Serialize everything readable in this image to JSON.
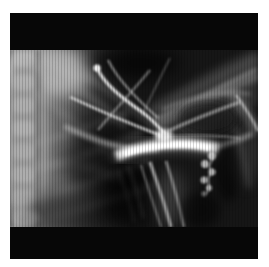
{
  "figure": {
    "type": "radiograph",
    "alt": "Black-and-white X-ray angiogram film showing the cervical spine and ribs on the left, contrast-filled arteries crossing the center and converging into a bright vascular trunk, with shoulder and arm soft tissue in the upper right"
  },
  "colors": {
    "page_background": "#ffffff",
    "film_black": "#070707",
    "exposed_base": "#161616",
    "tissue_gray": "#9a9a9a",
    "vessel_white": "#f2f2f2"
  }
}
